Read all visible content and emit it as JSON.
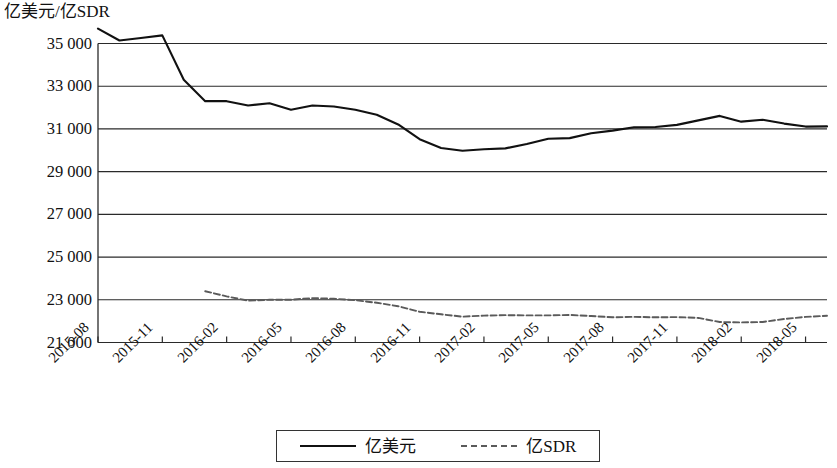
{
  "chart_data": {
    "type": "line",
    "title": "",
    "subtitle": "",
    "ylabel": "亿美元/亿SDR",
    "xlabel": "",
    "ylim": [
      21000,
      35000
    ],
    "yticks": [
      "35 000",
      "33 000",
      "31 000",
      "29 000",
      "27 000",
      "25 000",
      "23 000",
      "21 000"
    ],
    "ytick_values": [
      35000,
      33000,
      31000,
      29000,
      27000,
      25000,
      23000,
      21000
    ],
    "grid": true,
    "legend_position": "bottom",
    "x": [
      "2015-08",
      "2015-09",
      "2015-10",
      "2015-11",
      "2015-12",
      "2016-01",
      "2016-02",
      "2016-03",
      "2016-04",
      "2016-05",
      "2016-06",
      "2016-07",
      "2016-08",
      "2016-09",
      "2016-10",
      "2016-11",
      "2016-12",
      "2017-01",
      "2017-02",
      "2017-03",
      "2017-04",
      "2017-05",
      "2017-06",
      "2017-07",
      "2017-08",
      "2017-09",
      "2017-10",
      "2017-11",
      "2017-12",
      "2018-01",
      "2018-02",
      "2018-03",
      "2018-04",
      "2018-05",
      "2018-06"
    ],
    "xtick_labels": [
      "2015-08",
      "2015-11",
      "2016-02",
      "2016-05",
      "2016-08",
      "2016-11",
      "2017-02",
      "2017-05",
      "2017-08",
      "2017-11",
      "2018-02",
      "2018-05"
    ],
    "xtick_indices": [
      0,
      3,
      6,
      9,
      12,
      15,
      18,
      21,
      24,
      27,
      30,
      33
    ],
    "series": [
      {
        "name": "亿美元",
        "style": "solid",
        "color": "#111111",
        "values": [
          35700,
          35140,
          35260,
          35380,
          33300,
          32300,
          32300,
          32100,
          32200,
          31900,
          32100,
          32050,
          31900,
          31660,
          31210,
          30520,
          30110,
          29980,
          30050,
          30090,
          30290,
          30540,
          30570,
          30800,
          30920,
          31080,
          31090,
          31190,
          31400,
          31610,
          31340,
          31430,
          31250,
          31110,
          31120
        ]
      },
      {
        "name": "亿SDR",
        "style": "dashed",
        "color": "#5a5a5a",
        "values": [
          null,
          null,
          null,
          null,
          null,
          23400,
          23160,
          22960,
          23000,
          23000,
          23080,
          23050,
          22980,
          22860,
          22700,
          22440,
          22320,
          22210,
          22260,
          22280,
          22270,
          22270,
          22290,
          22240,
          22180,
          22200,
          22180,
          22190,
          22150,
          21960,
          21940,
          21960,
          22100,
          22200,
          22250
        ]
      }
    ]
  },
  "legend": {
    "items": [
      {
        "label": "亿美元",
        "style": "solid"
      },
      {
        "label": "亿SDR",
        "style": "dashed"
      }
    ]
  }
}
